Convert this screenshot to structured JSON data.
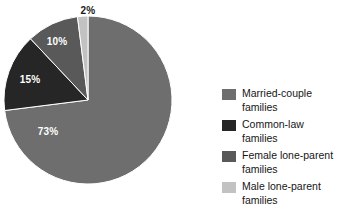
{
  "chart_data": {
    "type": "pie",
    "title": "",
    "subtitle": "",
    "xlabel": "",
    "ylabel": "",
    "grid": false,
    "legend_position": "right",
    "start_angle_deg": 0,
    "direction": "clockwise",
    "categories": [
      "Married-couple families",
      "Common-law families",
      "Female lone-parent families",
      "Male lone-parent families"
    ],
    "values": [
      73,
      15,
      10,
      2
    ],
    "value_unit": "%",
    "data_labels": [
      "73%",
      "15%",
      "10%",
      "2%"
    ],
    "colors": [
      "#6e6e6e",
      "#262626",
      "#595959",
      "#c2c2c2"
    ],
    "slices": [
      {
        "label": "Married-couple families",
        "value": 73,
        "data_label": "73%",
        "color": "#6e6e6e",
        "label_color": "#ffffff",
        "label_x": 48,
        "label_y": 126,
        "label_outside": false
      },
      {
        "label": "Common-law families",
        "value": 15,
        "data_label": "15%",
        "color": "#262626",
        "label_color": "#ffffff",
        "label_x": 30,
        "label_y": 74,
        "label_outside": false
      },
      {
        "label": "Female lone-parent families",
        "value": 10,
        "data_label": "10%",
        "color": "#595959",
        "label_color": "#ffffff",
        "label_x": 57,
        "label_y": 36,
        "label_outside": false
      },
      {
        "label": "Male lone-parent families",
        "value": 2,
        "data_label": "2%",
        "color": "#c2c2c2",
        "label_color": "#1a1a1a",
        "label_x": 88,
        "label_y": 5,
        "label_outside": true
      }
    ]
  },
  "legend": {
    "items": [
      {
        "color": "#6e6e6e",
        "line1": "Married-couple",
        "line2": "families",
        "name": "legend-item-married-couple"
      },
      {
        "color": "#262626",
        "line1": "Common-law",
        "line2": "families",
        "name": "legend-item-common-law"
      },
      {
        "color": "#595959",
        "line1": "Female lone-parent",
        "line2": "families",
        "name": "legend-item-female-lone-parent"
      },
      {
        "color": "#c2c2c2",
        "line1": "Male lone-parent",
        "line2": "families",
        "name": "legend-item-male-lone-parent"
      }
    ]
  },
  "geometry": {
    "center_x": 88,
    "center_y": 100,
    "radius": 84
  },
  "background_color": "#ffffff"
}
